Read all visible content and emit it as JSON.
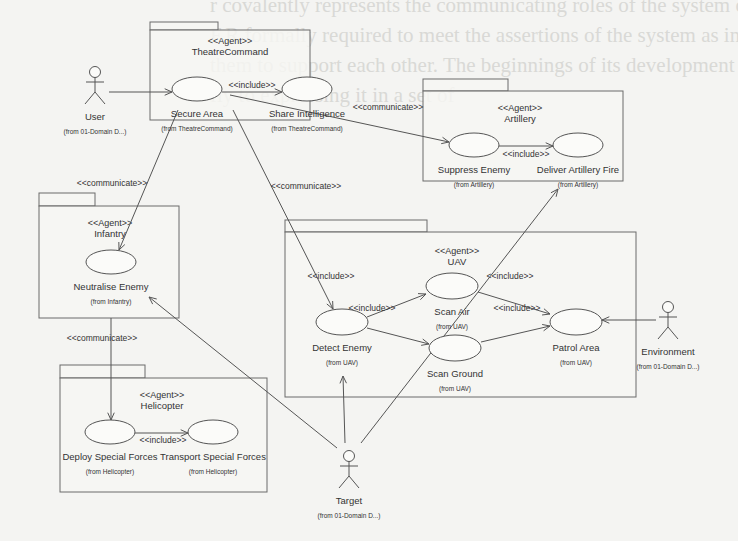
{
  "background_text": [
    "r covalently represents the communicating roles of the system of units",
    "F.R formally required to meet the assertions of the system as in a",
    "them to support each other. The beginnings of its development",
    "fly to expressing it in a set of"
  ],
  "colors": {
    "background": "#f4f4f2",
    "stroke": "#555555",
    "text": "#333333"
  },
  "packages": [
    {
      "id": "theatre",
      "stereotype": "<<Agent>>",
      "name": "TheatreCommand",
      "x": 150,
      "y": 30,
      "w": 160,
      "h": 90,
      "tabW": 68,
      "tabH": 8,
      "labelX": 230,
      "labelY": 44
    },
    {
      "id": "artillery",
      "stereotype": "<<Agent>>",
      "name": "Artillery",
      "x": 423,
      "y": 91,
      "w": 200,
      "h": 90,
      "tabW": 85,
      "tabH": 12,
      "labelX": 520,
      "labelY": 111
    },
    {
      "id": "infantry",
      "stereotype": "<<Agent>>",
      "name": "Infantry",
      "x": 39,
      "y": 206,
      "w": 140,
      "h": 112,
      "tabW": 56,
      "tabH": 13,
      "labelX": 110,
      "labelY": 226
    },
    {
      "id": "uav",
      "stereotype": "<<Agent>>",
      "name": "UAV",
      "x": 285,
      "y": 232,
      "w": 351,
      "h": 165,
      "tabW": 142,
      "tabH": 12,
      "labelX": 457,
      "labelY": 254
    },
    {
      "id": "helicopter",
      "stereotype": "<<Agent>>",
      "name": "Helicopter",
      "x": 60,
      "y": 378,
      "w": 207,
      "h": 114,
      "tabW": 85,
      "tabH": 13,
      "labelX": 162,
      "labelY": 398
    }
  ],
  "use_cases": [
    {
      "id": "secure_area",
      "name": "Secure Area",
      "from": "(from TheatreCommand)",
      "cx": 197,
      "cy": 89,
      "rx": 25,
      "ry": 12
    },
    {
      "id": "share_intel",
      "name": "Share Intelligence",
      "from": "(from TheatreCommand)",
      "cx": 307,
      "cy": 89,
      "rx": 25,
      "ry": 12
    },
    {
      "id": "suppress_enemy",
      "name": "Suppress Enemy",
      "from": "(from Artillery)",
      "cx": 474,
      "cy": 145,
      "rx": 25,
      "ry": 12
    },
    {
      "id": "deliver_fire",
      "name": "Deliver Artillery Fire",
      "from": "(from Artillery)",
      "cx": 578,
      "cy": 145,
      "rx": 25,
      "ry": 12
    },
    {
      "id": "neutralise_enemy",
      "name": "Neutralise Enemy",
      "from": "(from Infantry)",
      "cx": 111,
      "cy": 262,
      "rx": 25,
      "ry": 12
    },
    {
      "id": "scan_air",
      "name": "Scan Air",
      "from": "(from UAV)",
      "cx": 452,
      "cy": 286,
      "rx": 26,
      "ry": 13
    },
    {
      "id": "detect_enemy",
      "name": "Detect Enemy",
      "from": "(from UAV)",
      "cx": 342,
      "cy": 322,
      "rx": 26,
      "ry": 13
    },
    {
      "id": "scan_ground",
      "name": "Scan Ground",
      "from": "(from UAV)",
      "cx": 455,
      "cy": 348,
      "rx": 26,
      "ry": 13
    },
    {
      "id": "patrol_area",
      "name": "Patrol Area",
      "from": "(from UAV)",
      "cx": 576,
      "cy": 322,
      "rx": 26,
      "ry": 13
    },
    {
      "id": "deploy_sf",
      "name": "Deploy Special Forces",
      "from": "(from Helicopter)",
      "cx": 110,
      "cy": 432,
      "rx": 25,
      "ry": 12
    },
    {
      "id": "transport_sf",
      "name": "Transport Special Forces",
      "from": "(from Helicopter)",
      "cx": 213,
      "cy": 432,
      "rx": 25,
      "ry": 12
    }
  ],
  "actors": [
    {
      "id": "user",
      "name": "User",
      "from": "(from 01-Domain D...)",
      "x": 95,
      "y": 72
    },
    {
      "id": "environment",
      "name": "Environment",
      "from": "(from 01-Domain D...)",
      "x": 668,
      "y": 307
    },
    {
      "id": "target",
      "name": "Target",
      "from": "(from 01-Domain D...)",
      "x": 349,
      "y": 456
    }
  ],
  "relations": [
    {
      "type": "association",
      "label": "",
      "x1": 109,
      "y1": 92,
      "x2": 172,
      "y2": 92,
      "arrow": true
    },
    {
      "type": "include",
      "label": "<<include>>",
      "x1": 222,
      "y1": 92,
      "x2": 282,
      "y2": 92,
      "arrow": true,
      "lx": 252,
      "ly": 88
    },
    {
      "type": "communicate",
      "label": "<<communicate>>",
      "x1": 230,
      "y1": 95,
      "x2": 449,
      "y2": 142,
      "arrow": true,
      "lx": 388,
      "ly": 110
    },
    {
      "type": "include",
      "label": "<<include>>",
      "x1": 499,
      "y1": 146,
      "x2": 553,
      "y2": 146,
      "arrow": true,
      "lx": 526,
      "ly": 157
    },
    {
      "type": "communicate",
      "label": "<<communicate>>",
      "x1": 178,
      "y1": 110,
      "x2": 119,
      "y2": 250,
      "arrow": true,
      "lx": 112,
      "ly": 186
    },
    {
      "type": "communicate",
      "label": "<<communicate>>",
      "x1": 233,
      "y1": 110,
      "x2": 333,
      "y2": 309,
      "arrow": true,
      "lx": 306,
      "ly": 189
    },
    {
      "type": "communicate",
      "label": "<<communicate>>",
      "x1": 111,
      "y1": 318,
      "x2": 111,
      "y2": 420,
      "arrow": true,
      "lx": 102,
      "ly": 341
    },
    {
      "type": "include",
      "label": "<<include>>",
      "x1": 135,
      "y1": 433,
      "x2": 188,
      "y2": 433,
      "arrow": true,
      "lx": 163,
      "ly": 443
    },
    {
      "type": "include",
      "label": "<<include>>",
      "x1": 367,
      "y1": 317,
      "x2": 426,
      "y2": 294,
      "arrow": true,
      "lx": 372,
      "ly": 311
    },
    {
      "type": "plain",
      "label": "<<include>>",
      "x1": 0,
      "y1": 0,
      "x2": 0,
      "y2": 0,
      "arrow": false,
      "lx": 331,
      "ly": 279
    },
    {
      "type": "include",
      "label": "",
      "x1": 367,
      "y1": 328,
      "x2": 429,
      "y2": 344,
      "arrow": true
    },
    {
      "type": "include",
      "label": "<<include>>",
      "x1": 478,
      "y1": 292,
      "x2": 550,
      "y2": 314,
      "arrow": true,
      "lx": 510,
      "ly": 279
    },
    {
      "type": "include",
      "label": "<<include>>",
      "x1": 481,
      "y1": 342,
      "x2": 550,
      "y2": 326,
      "arrow": true,
      "lx": 517,
      "ly": 311
    },
    {
      "type": "association",
      "label": "",
      "x1": 656,
      "y1": 320,
      "x2": 602,
      "y2": 320,
      "arrow": true
    },
    {
      "type": "association",
      "label": "",
      "x1": 345,
      "y1": 443,
      "x2": 343,
      "y2": 376,
      "arrow": true
    },
    {
      "type": "association",
      "label": "",
      "x1": 337,
      "y1": 448,
      "x2": 149,
      "y2": 297,
      "arrow": true
    },
    {
      "type": "association",
      "label": "",
      "x1": 361,
      "y1": 443,
      "x2": 558,
      "y2": 189,
      "arrow": true
    }
  ]
}
